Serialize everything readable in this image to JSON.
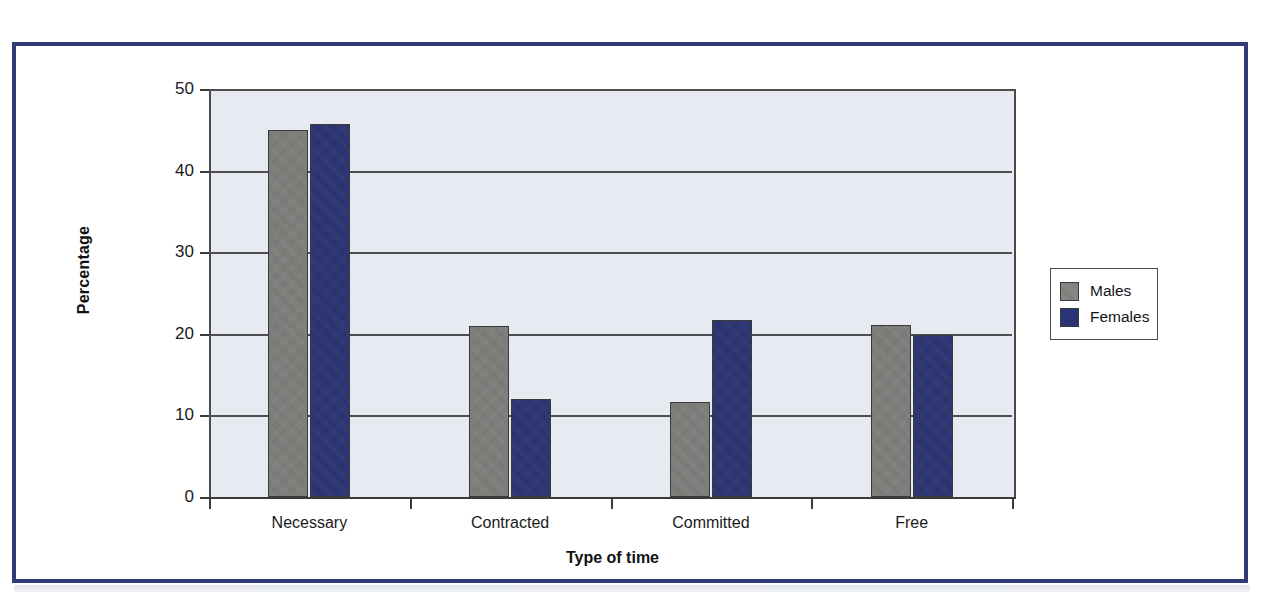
{
  "figure": {
    "frame_color": "#2f3b74",
    "plot_background": "#e7ebf1",
    "axis_color": "#3a3a3a"
  },
  "chart_data": {
    "type": "bar",
    "title": "",
    "subtitle": "",
    "xlabel": "Type of time",
    "ylabel": "Percentage",
    "categories": [
      "Necessary",
      "Contracted",
      "Committed",
      "Free"
    ],
    "series": [
      {
        "name": "Males",
        "color": "#7b7b78",
        "values": [
          45.0,
          20.9,
          11.7,
          21.1
        ]
      },
      {
        "name": "Females",
        "color": "#2a3373",
        "values": [
          45.7,
          12.0,
          21.7,
          19.8
        ]
      }
    ],
    "ylim": [
      0,
      50
    ],
    "yticks": [
      0,
      10,
      20,
      30,
      40,
      50
    ],
    "ytick_labels": [
      "0",
      "10",
      "20",
      "30",
      "40",
      "50"
    ],
    "grid": "horizontal",
    "legend_position": "right",
    "legend_entries": [
      "Males",
      "Females"
    ]
  }
}
